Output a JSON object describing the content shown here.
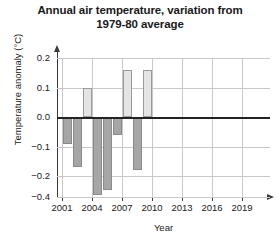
{
  "chart_data": {
    "type": "bar",
    "title": "Annual air temperature, variation from 1979-80 average",
    "title_line1": "Annual air temperature, variation from",
    "title_line2": "1979-80 average",
    "xlabel": "Year",
    "ylabel": "Temperature anomaly (°C)",
    "xlim": [
      2000,
      2019.5
    ],
    "ylim": [
      -0.4,
      0.2
    ],
    "grid": "horizontal-and-vertical-light",
    "legend": "none",
    "zero_reference_line": 0.0,
    "bar_colors": {
      "positive": "#e4e4e4",
      "negative": "#a6a6a6",
      "outline": "#9a9a9a",
      "zero_line": "#222222",
      "gridline": "#c8c8c8",
      "axis": "#3a3a3a"
    },
    "ytick_labels": [
      "0.2",
      "0.1",
      "0.0",
      "−0.1",
      "−0.2",
      "−0.4"
    ],
    "ytick_values": [
      0.2,
      0.1,
      0.0,
      -0.1,
      -0.2,
      -0.4
    ],
    "xtick_labels": [
      "2001",
      "2004",
      "2007",
      "2010",
      "2013",
      "2016",
      "2019"
    ],
    "xtick_values": [
      2001,
      2004,
      2007,
      2010,
      2013,
      2016,
      2019
    ],
    "categories": [
      2001,
      2002,
      2003,
      2004,
      2005,
      2006,
      2007,
      2008,
      2009,
      2010
    ],
    "values": [
      -0.09,
      -0.17,
      0.1,
      -0.38,
      -0.33,
      -0.06,
      0.16,
      -0.18,
      0.16,
      0.0
    ],
    "series": [
      {
        "name": "Temperature anomaly",
        "values": [
          -0.09,
          -0.17,
          0.1,
          -0.38,
          -0.33,
          -0.06,
          0.16,
          -0.18,
          0.16,
          0.0
        ]
      }
    ]
  }
}
